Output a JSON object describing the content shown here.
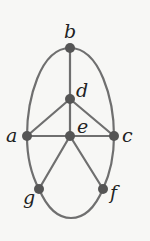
{
  "diagram": {
    "type": "graph",
    "colors": {
      "edge": "#6f6f6f",
      "node": "#555555",
      "label": "#222222",
      "background": "#f7f7f5"
    },
    "nodes": [
      {
        "id": "a",
        "label": "a",
        "x": 27,
        "y": 136
      },
      {
        "id": "b",
        "label": "b",
        "x": 70,
        "y": 48
      },
      {
        "id": "c",
        "label": "c",
        "x": 114,
        "y": 136
      },
      {
        "id": "d",
        "label": "d",
        "x": 70,
        "y": 99
      },
      {
        "id": "e",
        "label": "e",
        "x": 70,
        "y": 136
      },
      {
        "id": "f",
        "label": "f",
        "x": 103,
        "y": 189
      },
      {
        "id": "g",
        "label": "g",
        "x": 39,
        "y": 189
      }
    ],
    "edges": [
      [
        "b",
        "a"
      ],
      [
        "b",
        "c"
      ],
      [
        "b",
        "d"
      ],
      [
        "d",
        "a"
      ],
      [
        "d",
        "c"
      ],
      [
        "d",
        "e"
      ],
      [
        "a",
        "e"
      ],
      [
        "e",
        "c"
      ],
      [
        "a",
        "g"
      ],
      [
        "c",
        "f"
      ],
      [
        "e",
        "g"
      ],
      [
        "e",
        "f"
      ],
      [
        "g",
        "f"
      ]
    ]
  }
}
